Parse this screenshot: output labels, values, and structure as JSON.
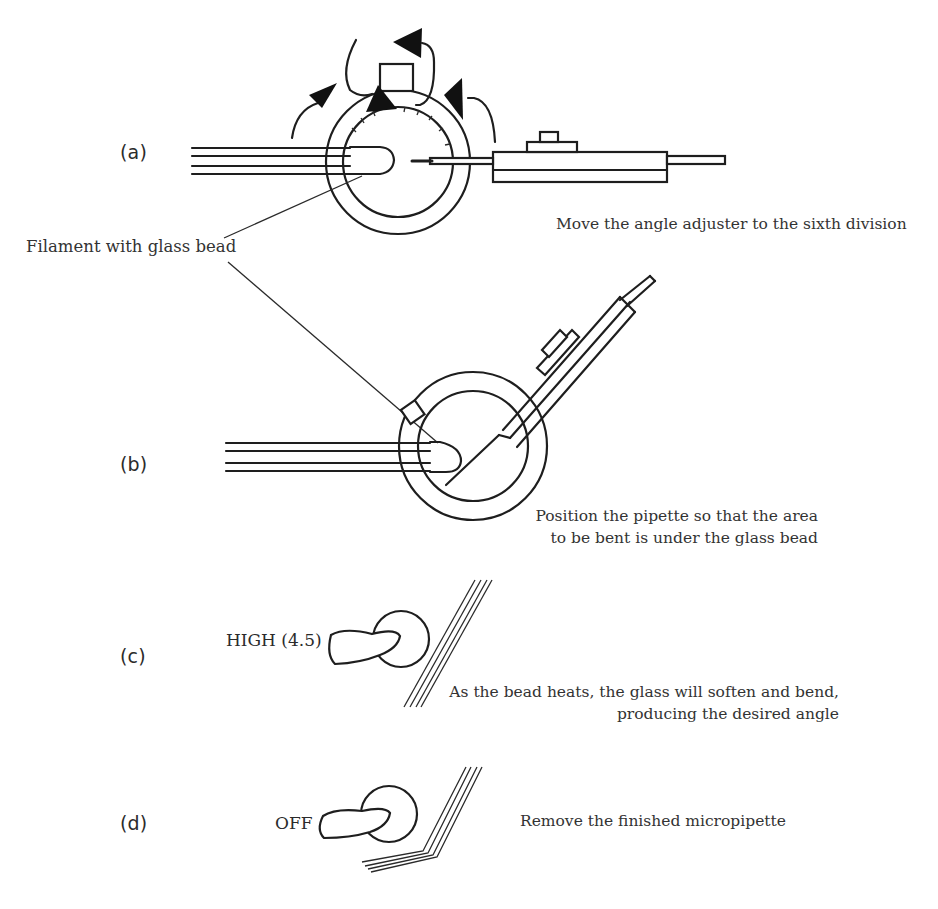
{
  "figure": {
    "panels": [
      {
        "id": "a",
        "label": "(a)",
        "caption_lines": [
          "Move the angle adjuster to the sixth division"
        ]
      },
      {
        "id": "b",
        "label": "(b)",
        "caption_lines": [
          "Position the pipette so that the area",
          "to be bent is under the glass bead"
        ]
      },
      {
        "id": "c",
        "label": "(c)",
        "knob_setting": "HIGH (4.5)",
        "caption_lines": [
          "As the bead heats, the glass will soften and bend,",
          "producing the desired angle"
        ]
      },
      {
        "id": "d",
        "label": "(d)",
        "knob_setting": "OFF",
        "caption_lines": [
          "Remove the finished micropipette"
        ]
      }
    ],
    "callout": "Filament with glass bead"
  },
  "colors": {
    "line": "#1e1e1e",
    "text": "#333333",
    "background": "#ffffff"
  }
}
